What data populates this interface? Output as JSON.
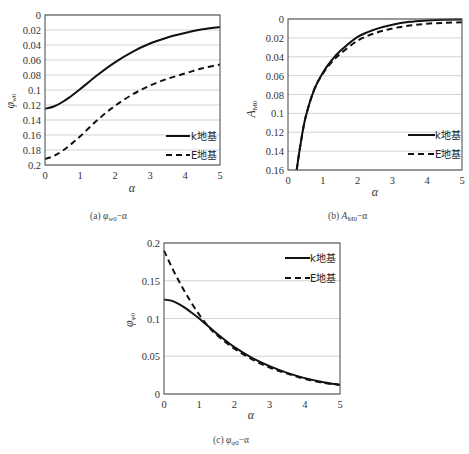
{
  "chart_data": [
    {
      "id": "a",
      "type": "line",
      "caption": "(a) φw0−α",
      "caption_prefix": "(a) ",
      "caption_symbol": "φ",
      "caption_sub": "w0",
      "caption_suffix": "−α",
      "xlabel": "α",
      "ylabel": "φ",
      "ylabel_sub": "w0",
      "xlim": [
        0,
        5
      ],
      "ylim": [
        0,
        0.2
      ],
      "y_inverted": true,
      "grid": true,
      "x_ticks": [
        "0",
        "1",
        "2",
        "3",
        "4",
        "5"
      ],
      "y_ticks": [
        "0",
        "0.02",
        "0.04",
        "0.06",
        "0.08",
        "0.1",
        "0.12",
        "0.14",
        "0.16",
        "0.18",
        "0.2"
      ],
      "legend_position": "lower right",
      "series": [
        {
          "name": "k地基",
          "style": "solid",
          "x": [
            0,
            0.25,
            0.5,
            0.75,
            1,
            1.5,
            2,
            2.5,
            3,
            3.5,
            4,
            4.5,
            5
          ],
          "y": [
            0.125,
            0.122,
            0.116,
            0.108,
            0.099,
            0.08,
            0.063,
            0.049,
            0.038,
            0.03,
            0.024,
            0.019,
            0.016
          ]
        },
        {
          "name": "E地基",
          "style": "dashed",
          "x": [
            0,
            0.25,
            0.5,
            0.75,
            1,
            1.5,
            2,
            2.5,
            3,
            3.5,
            4,
            4.5,
            5
          ],
          "y": [
            0.192,
            0.188,
            0.181,
            0.172,
            0.162,
            0.14,
            0.121,
            0.106,
            0.094,
            0.085,
            0.078,
            0.071,
            0.066
          ]
        }
      ]
    },
    {
      "id": "b",
      "type": "line",
      "caption": "(b) AM0−α",
      "caption_prefix": "(b) ",
      "caption_symbol": "A",
      "caption_sub": "M0",
      "caption_suffix": "−α",
      "xlabel": "α",
      "ylabel": "A",
      "ylabel_sub": "M0",
      "xlim": [
        0,
        5
      ],
      "ylim": [
        0,
        0.16
      ],
      "y_inverted": true,
      "grid": true,
      "x_ticks": [
        "0",
        "1",
        "2",
        "3",
        "4",
        "5"
      ],
      "y_ticks": [
        "0",
        "0.02",
        "0.04",
        "0.06",
        "0.08",
        "0.1",
        "0.12",
        "0.14",
        "0.16"
      ],
      "legend_position": "lower right",
      "series": [
        {
          "name": "k地基",
          "style": "solid",
          "x": [
            0.25,
            0.35,
            0.5,
            0.75,
            1,
            1.25,
            1.5,
            2,
            2.5,
            3,
            3.5,
            4,
            4.5,
            5
          ],
          "y": [
            0.16,
            0.135,
            0.105,
            0.075,
            0.057,
            0.044,
            0.034,
            0.019,
            0.011,
            0.006,
            0.003,
            0.0015,
            0.0008,
            0.0005
          ]
        },
        {
          "name": "E地基",
          "style": "dashed",
          "x": [
            0.25,
            0.35,
            0.5,
            0.75,
            1,
            1.25,
            1.5,
            2,
            2.5,
            3,
            3.5,
            4,
            4.5,
            5
          ],
          "y": [
            0.16,
            0.135,
            0.105,
            0.075,
            0.058,
            0.046,
            0.037,
            0.023,
            0.015,
            0.01,
            0.007,
            0.005,
            0.004,
            0.0035
          ]
        }
      ]
    },
    {
      "id": "c",
      "type": "line",
      "caption": "(c) φφ0−α",
      "caption_prefix": "(c) ",
      "caption_symbol": "φ",
      "caption_sub": "φ0",
      "caption_suffix": "−α",
      "xlabel": "α",
      "ylabel": "φ",
      "ylabel_sub": "φ0",
      "xlim": [
        0,
        5
      ],
      "ylim": [
        0,
        0.2
      ],
      "y_inverted": false,
      "grid": true,
      "x_ticks": [
        "0",
        "1",
        "2",
        "3",
        "4",
        "5"
      ],
      "y_ticks": [
        "0",
        "0.05",
        "0.1",
        "0.15",
        "0.2"
      ],
      "legend_position": "upper right",
      "series": [
        {
          "name": "k地基",
          "style": "solid",
          "x": [
            0,
            0.25,
            0.5,
            0.75,
            1,
            1.5,
            2,
            2.5,
            3,
            3.5,
            4,
            4.5,
            5
          ],
          "y": [
            0.125,
            0.123,
            0.117,
            0.109,
            0.1,
            0.08,
            0.062,
            0.048,
            0.037,
            0.028,
            0.021,
            0.016,
            0.012
          ]
        },
        {
          "name": "E地基",
          "style": "dashed",
          "x": [
            0,
            0.25,
            0.5,
            0.75,
            1,
            1.25,
            1.5,
            2,
            2.5,
            3,
            3.5,
            4,
            4.5,
            5
          ],
          "y": [
            0.19,
            0.165,
            0.143,
            0.123,
            0.105,
            0.09,
            0.078,
            0.06,
            0.046,
            0.035,
            0.027,
            0.02,
            0.015,
            0.012
          ]
        }
      ]
    }
  ]
}
